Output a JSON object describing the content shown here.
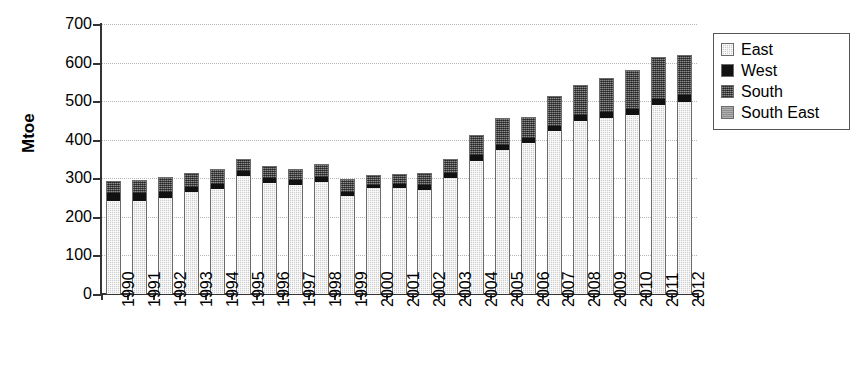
{
  "chart_data": {
    "type": "bar",
    "subtype": "stacked-column",
    "title": "",
    "xlabel": "",
    "ylabel": "Mtoe",
    "ylim": [
      0,
      700
    ],
    "yticks": [
      0,
      100,
      200,
      300,
      400,
      500,
      600,
      700
    ],
    "grid": true,
    "legend_position": "right",
    "categories": [
      "1990",
      "1991",
      "1992",
      "1993",
      "1994",
      "1995",
      "1996",
      "1997",
      "1998",
      "1999",
      "2000",
      "2001",
      "2002",
      "2003",
      "2004",
      "2005",
      "2006",
      "2007",
      "2008",
      "2009",
      "2010",
      "2011",
      "2012"
    ],
    "series": [
      {
        "name": "East",
        "color": "#cdcdcd",
        "values": [
          243,
          244,
          251,
          267,
          275,
          307,
          290,
          285,
          293,
          256,
          276,
          276,
          272,
          303,
          348,
          375,
          393,
          424,
          450,
          458,
          466,
          492,
          500
        ]
      },
      {
        "name": "West",
        "color": "#111111",
        "values": [
          20,
          19,
          15,
          13,
          13,
          14,
          14,
          13,
          14,
          12,
          10,
          11,
          12,
          13,
          14,
          14,
          14,
          15,
          16,
          16,
          16,
          17,
          18
        ]
      },
      {
        "name": "South",
        "color": "#5a5a5a",
        "values": [
          31,
          32,
          37,
          35,
          37,
          29,
          28,
          27,
          29,
          31,
          22,
          23,
          30,
          35,
          50,
          68,
          51,
          75,
          77,
          86,
          99,
          106,
          102
        ]
      },
      {
        "name": "South East",
        "color": "#8f8f8f",
        "values": [
          0,
          0,
          0,
          0,
          0,
          0,
          0,
          0,
          0,
          0,
          0,
          0,
          0,
          0,
          0,
          0,
          0,
          0,
          0,
          0,
          0,
          0,
          0
        ]
      }
    ],
    "totals": [
      294,
      295,
      303,
      315,
      325,
      350,
      332,
      325,
      336,
      299,
      308,
      310,
      314,
      351,
      412,
      457,
      458,
      514,
      543,
      560,
      581,
      615,
      620
    ]
  },
  "legend": {
    "items": [
      {
        "label": "East",
        "swatch": "east-swatch"
      },
      {
        "label": "West",
        "swatch": "west-swatch"
      },
      {
        "label": "South",
        "swatch": "south-swatch"
      },
      {
        "label": "South East",
        "swatch": "south-east-swatch"
      }
    ]
  },
  "axis": {
    "y_title": "Mtoe",
    "y_tick_labels": [
      "700",
      "600",
      "500",
      "400",
      "300",
      "200",
      "100",
      "0"
    ]
  }
}
